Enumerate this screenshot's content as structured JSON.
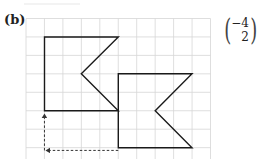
{
  "part_label": "(b)",
  "vector": {
    "x": "−4",
    "y": "2"
  },
  "grid": {
    "origin_x": 26,
    "origin_y": 18.5,
    "cell": 18.45,
    "cols": 10,
    "rows": 8,
    "color": "#d6d6d6"
  },
  "shapes": {
    "original": {
      "name": "flag-shape-original",
      "points_grid": [
        [
          1,
          1
        ],
        [
          5,
          1
        ],
        [
          3,
          3
        ],
        [
          5,
          5
        ],
        [
          1,
          5
        ]
      ]
    },
    "image": {
      "name": "flag-shape-translated",
      "points_grid": [
        [
          5,
          3
        ],
        [
          9,
          3
        ],
        [
          7,
          5
        ],
        [
          9,
          7
        ],
        [
          5,
          7
        ]
      ]
    },
    "stroke": "#1a1a1a"
  },
  "arrows": {
    "horizontal": {
      "from_grid": [
        5,
        7.15
      ],
      "to_grid": [
        1,
        7.15
      ],
      "label": "4 left"
    },
    "vertical": {
      "from_grid": [
        1,
        7.15
      ],
      "to_grid": [
        1,
        5.2
      ],
      "label": "2 up"
    },
    "color": "#333333"
  }
}
